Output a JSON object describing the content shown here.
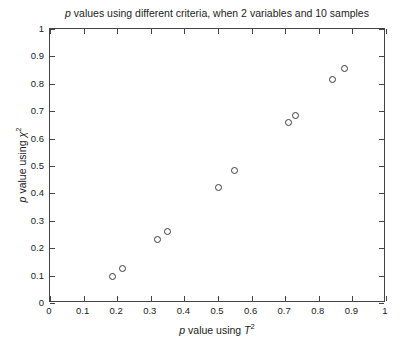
{
  "chart_data": {
    "type": "scatter",
    "title": "p values using different criteria, when 2 variables and 10 samples",
    "title_prefix_italic": "p",
    "title_rest": " values using different criteria, when 2 variables and 10 samples",
    "xlabel": "p value using T²",
    "ylabel": "p value using χ²",
    "xlabel_parts": {
      "italic_p": "p",
      "mid": " value using ",
      "italic_sym": "T",
      "sup": "2"
    },
    "ylabel_parts": {
      "italic_p": "p",
      "mid": " value using ",
      "italic_sym": "χ",
      "sup": "2"
    },
    "xlim": [
      0,
      1
    ],
    "ylim": [
      0,
      1
    ],
    "xticks": [
      0,
      0.1,
      0.2,
      0.3,
      0.4,
      0.5,
      0.6,
      0.7,
      0.8,
      0.9,
      1
    ],
    "yticks": [
      0,
      0.1,
      0.2,
      0.3,
      0.4,
      0.5,
      0.6,
      0.7,
      0.8,
      0.9,
      1
    ],
    "xtick_labels": [
      "0",
      "0.1",
      "0.2",
      "0.3",
      "0.4",
      "0.5",
      "0.6",
      "0.7",
      "0.8",
      "0.9",
      "1"
    ],
    "ytick_labels": [
      "0",
      "0.1",
      "0.2",
      "0.3",
      "0.4",
      "0.5",
      "0.6",
      "0.7",
      "0.8",
      "0.9",
      "1"
    ],
    "grid": false,
    "legend": false,
    "marker": "open-circle",
    "marker_color": "#3a3a3a",
    "axis_color": "#444444",
    "background": "#ffffff",
    "x": [
      0.185,
      0.215,
      0.32,
      0.35,
      0.5,
      0.55,
      0.71,
      0.73,
      0.84,
      0.875
    ],
    "y": [
      0.095,
      0.125,
      0.23,
      0.26,
      0.42,
      0.485,
      0.66,
      0.685,
      0.815,
      0.855
    ],
    "points": [
      {
        "x": 0.185,
        "y": 0.095
      },
      {
        "x": 0.215,
        "y": 0.125
      },
      {
        "x": 0.32,
        "y": 0.23
      },
      {
        "x": 0.35,
        "y": 0.26
      },
      {
        "x": 0.5,
        "y": 0.42
      },
      {
        "x": 0.55,
        "y": 0.485
      },
      {
        "x": 0.71,
        "y": 0.66
      },
      {
        "x": 0.73,
        "y": 0.685
      },
      {
        "x": 0.84,
        "y": 0.815
      },
      {
        "x": 0.875,
        "y": 0.855
      }
    ]
  }
}
